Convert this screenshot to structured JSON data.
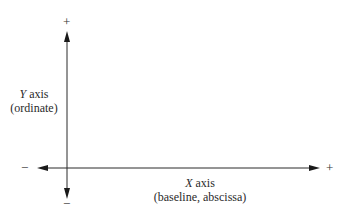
{
  "diagram": {
    "y_axis": {
      "name_letter": "Y",
      "name_rest": " axis",
      "subtitle": "(ordinate)",
      "positive_sign": "+",
      "negative_sign": "−"
    },
    "x_axis": {
      "name_letter": "X",
      "name_rest": " axis",
      "subtitle": "(baseline, abscissa)",
      "positive_sign": "+",
      "negative_sign": "−"
    },
    "colors": {
      "line": "#2a2a2a",
      "background": "#ffffff"
    }
  }
}
